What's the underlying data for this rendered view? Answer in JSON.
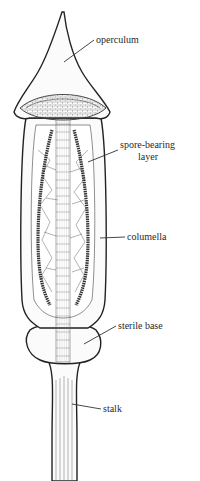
{
  "diagram": {
    "labels": [
      {
        "id": "operculum",
        "text": "operculum",
        "x": 96,
        "y": 43
      },
      {
        "id": "spore-bearing-layer-1",
        "text": "spore-bearing",
        "x": 120,
        "y": 148
      },
      {
        "id": "spore-bearing-layer-2",
        "text": "layer",
        "x": 138,
        "y": 160
      },
      {
        "id": "columella",
        "text": "columella",
        "x": 127,
        "y": 240
      },
      {
        "id": "sterile-base",
        "text": "sterile base",
        "x": 118,
        "y": 329
      },
      {
        "id": "stalk",
        "text": "stalk",
        "x": 103,
        "y": 412
      }
    ],
    "parts": [
      "operculum",
      "spore-bearing layer",
      "columella",
      "sterile base",
      "stalk"
    ]
  }
}
